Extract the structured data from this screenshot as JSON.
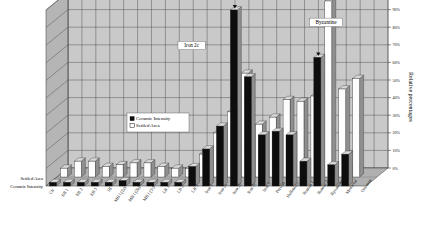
{
  "chart_data": {
    "type": "bar",
    "title": "",
    "subtitle": "",
    "xlabel": "",
    "ylabel": "Relative percentages",
    "ylim": [
      0,
      100
    ],
    "grid": true,
    "legend_position": "inside-left",
    "projection": "3d-two-row",
    "tick_labels": [
      "0%",
      "10%",
      "20%",
      "30%",
      "40%",
      "50%",
      "60%",
      "70%",
      "80%",
      "90%",
      "100%"
    ],
    "tick_values": [
      0,
      10,
      20,
      30,
      40,
      50,
      60,
      70,
      80,
      90,
      100
    ],
    "categories": [
      "Ch",
      "EB 1",
      "EB 2",
      "EB 3",
      "IB",
      "MB I (2a)",
      "MB I (2b)",
      "MB I (2c)",
      "LB 1",
      "LB 2",
      "LB 3",
      "Iron 1",
      "Iron 2a",
      "Iron 2b",
      "Iron 2c",
      "Iron 3",
      "Persian",
      "Hellenistic",
      "Roman 1",
      "Roman 2",
      "Byzantine",
      "Medieval",
      "Ottoman"
    ],
    "series": [
      {
        "name": "Ceramic Intensity",
        "color": "#0d0d0d",
        "row": "front",
        "values": [
          2,
          2,
          2,
          2,
          2,
          3,
          2,
          2,
          2,
          2,
          11,
          21,
          34,
          100,
          62,
          29,
          31,
          29,
          14,
          73,
          12,
          18,
          0
        ]
      },
      {
        "name": "Settled Area",
        "color": "#fdfdfd",
        "row": "back",
        "values": [
          5,
          9,
          9,
          6,
          7,
          8,
          8,
          6,
          5,
          5,
          13,
          25,
          37,
          59,
          30,
          34,
          44,
          43,
          46,
          100,
          50,
          56,
          0
        ]
      }
    ],
    "annotations": [
      {
        "text": "Iron 2c",
        "x_frac": 0.455,
        "y_frac": 0.215,
        "boxed": true
      },
      {
        "text": "Byzantine",
        "x_frac": 0.875,
        "y_frac": 0.085,
        "boxed": true
      }
    ],
    "markers": [
      {
        "kind": "down-arrow",
        "category": "Iron 2b"
      },
      {
        "kind": "down-arrow",
        "category": "Roman 2"
      }
    ],
    "row_labels": [
      "Settled Area",
      "Ceramic Intensity"
    ]
  },
  "legend": {
    "items": [
      {
        "label": "Ceramic Intensity",
        "swatch": "filled"
      },
      {
        "label": "Settled Area",
        "swatch": "hollow"
      }
    ]
  },
  "axis": {
    "y_title": "Relative percentages"
  },
  "colors": {
    "plot_background": "#c9c9c9",
    "grid_line": "#4a4a4a",
    "wall_side": "#b5b5b5",
    "floor": "#b0b0b0",
    "bar_black": "#0d0d0d",
    "bar_white": "#fdfdfd",
    "bar_side": "#8f8f8f",
    "bar_top": "#d8d8d8",
    "page_background": "#ffffff"
  }
}
